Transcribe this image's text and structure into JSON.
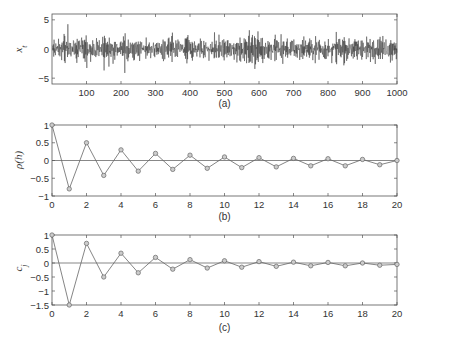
{
  "chart_data": [
    {
      "type": "line",
      "panel_label": "(a)",
      "ylabel": "x_t",
      "xlabel": "",
      "xlim": [
        0,
        1000
      ],
      "ylim": [
        -6,
        6
      ],
      "xticks": [
        100,
        200,
        300,
        400,
        500,
        600,
        700,
        800,
        900,
        1000
      ],
      "yticks": [
        -5,
        0,
        5
      ],
      "description": "Noisy time series of 1000 samples fluctuating around 0, mostly within ±3 with spikes to about ±5",
      "series": [
        {
          "name": "x_t",
          "n_points": 1000,
          "mean": 0,
          "approx_std": 1.4,
          "approx_range": [
            -5.5,
            5
          ]
        }
      ],
      "grid": false
    },
    {
      "type": "line",
      "panel_label": "(b)",
      "ylabel": "ρ(h)",
      "xlabel": "",
      "xlim": [
        0,
        20
      ],
      "ylim": [
        -1,
        1
      ],
      "xticks": [
        0,
        2,
        4,
        6,
        8,
        10,
        12,
        14,
        16,
        18,
        20
      ],
      "yticks": [
        -1,
        -0.5,
        0,
        0.5,
        1
      ],
      "x": [
        0,
        1,
        2,
        3,
        4,
        5,
        6,
        7,
        8,
        9,
        10,
        11,
        12,
        13,
        14,
        15,
        16,
        17,
        18,
        19,
        20
      ],
      "series": [
        {
          "name": "ρ(h)",
          "marker": "circle",
          "values": [
            1,
            -0.8,
            0.5,
            -0.42,
            0.3,
            -0.3,
            0.2,
            -0.25,
            0.15,
            -0.22,
            0.1,
            -0.2,
            0.08,
            -0.18,
            0.06,
            -0.15,
            0.05,
            -0.15,
            0.03,
            -0.12,
            0.0
          ]
        }
      ],
      "zero_line": true,
      "grid": false
    },
    {
      "type": "line",
      "panel_label": "(c)",
      "ylabel": "c_j",
      "xlabel": "",
      "xlim": [
        0,
        20
      ],
      "ylim": [
        -1.5,
        1
      ],
      "xticks": [
        0,
        2,
        4,
        6,
        8,
        10,
        12,
        14,
        16,
        18,
        20
      ],
      "yticks": [
        -1.5,
        -1,
        -0.5,
        0,
        0.5,
        1
      ],
      "x": [
        0,
        1,
        2,
        3,
        4,
        5,
        6,
        7,
        8,
        9,
        10,
        11,
        12,
        13,
        14,
        15,
        16,
        17,
        18,
        19,
        20
      ],
      "series": [
        {
          "name": "c_j",
          "marker": "circle",
          "values": [
            1,
            -1.5,
            0.7,
            -0.5,
            0.35,
            -0.35,
            0.2,
            -0.22,
            0.12,
            -0.18,
            0.08,
            -0.15,
            0.05,
            -0.12,
            0.03,
            -0.1,
            0.02,
            -0.1,
            0.0,
            -0.08,
            -0.05
          ]
        }
      ],
      "zero_line": true,
      "grid": false
    }
  ],
  "style": {
    "axis_color": "#555555",
    "line_color": "#666666",
    "noise_color": "#2a2a2a",
    "marker_fill": "#cccccc"
  }
}
